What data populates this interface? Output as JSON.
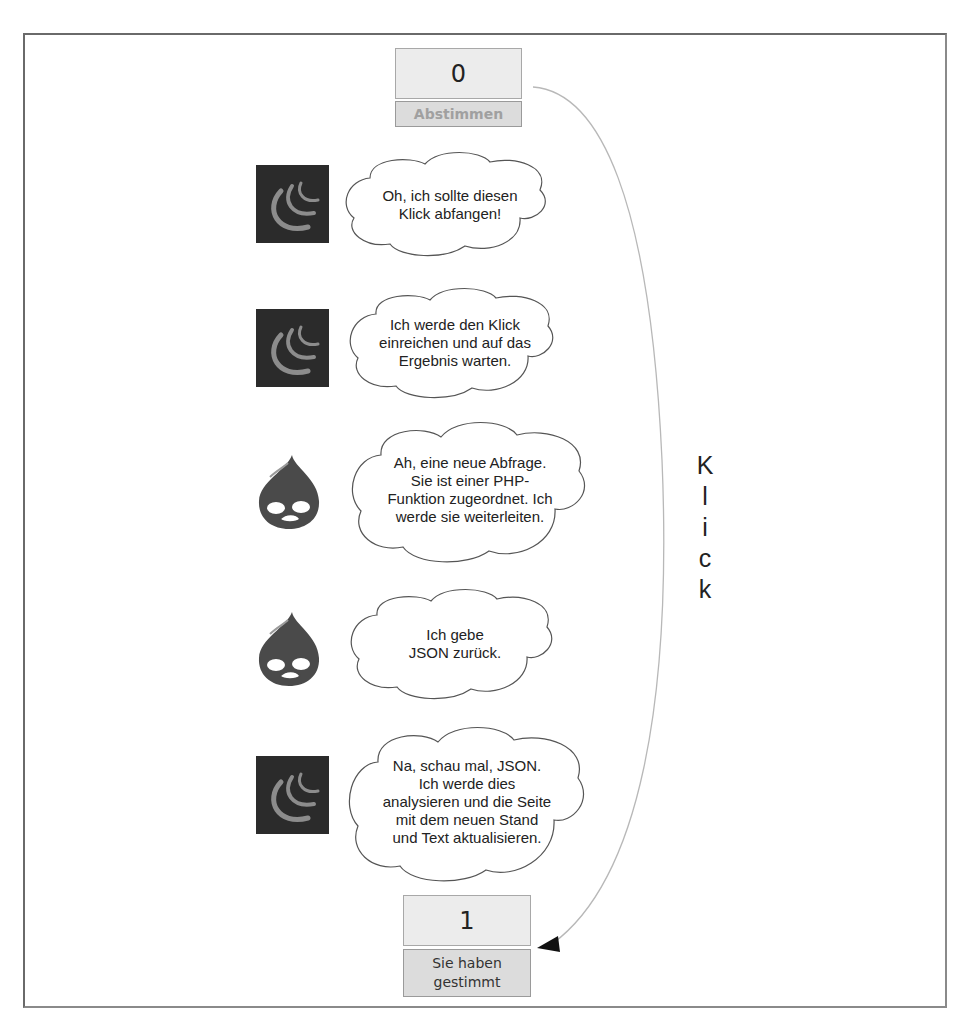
{
  "diagram": {
    "before": {
      "count": "0",
      "button_label": "Abstimmen",
      "button_state": "disabled"
    },
    "after": {
      "count": "1",
      "button_label": "Sie haben\ngestimmt"
    },
    "flow_label_letters": [
      "K",
      "l",
      "i",
      "c",
      "k"
    ],
    "flow_label": "Klick",
    "steps": [
      {
        "actor": "jquery-logo",
        "text": "Oh, ich sollte diesen\nKlick abfangen!"
      },
      {
        "actor": "jquery-logo",
        "text": "Ich werde den Klick\neinreichen und auf das\nErgebnis warten."
      },
      {
        "actor": "drupal-logo",
        "text": "Ah, eine neue Abfrage.\nSie ist einer PHP-\nFunktion zugeordnet. Ich\nwerde sie weiterleiten."
      },
      {
        "actor": "drupal-logo",
        "text": "Ich gebe\nJSON zurück."
      },
      {
        "actor": "jquery-logo",
        "text": "Na, schau mal, JSON.\nIch werde dies\nanalysieren und die Seite\nmit dem neuen Stand\nund Text aktualisieren."
      }
    ],
    "colors": {
      "frame": "#6a6a6a",
      "counter_bg": "#ececec",
      "button_bg": "#dcdcdc",
      "jquery_bg": "#2b2b2b",
      "jquery_arc": "#8c8c8c",
      "drupal": "#4a4a4a"
    }
  }
}
